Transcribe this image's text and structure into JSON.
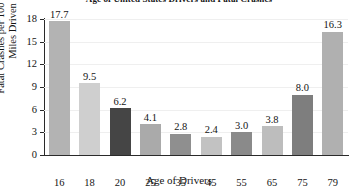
{
  "chart_data": {
    "type": "bar",
    "title": "Age of United States Drivers and Fatal Crashes",
    "xlabel": "Age of Drivers",
    "ylabel": "Fatal Crashes per 100 Million\nMiles Driven",
    "categories": [
      "16",
      "18",
      "20",
      "25",
      "35",
      "45",
      "55",
      "65",
      "75",
      "79"
    ],
    "values": [
      17.7,
      9.5,
      6.2,
      4.1,
      2.8,
      2.4,
      3.0,
      3.8,
      8.0,
      16.3
    ],
    "value_labels": [
      "17.7",
      "9.5",
      "6.2",
      "4.1",
      "2.8",
      "2.4",
      "3.0",
      "3.8",
      "8.0",
      "16.3"
    ],
    "bar_colors": [
      "#b3b3b3",
      "#cfcfcf",
      "#454545",
      "#aaaaaa",
      "#8f8f8f",
      "#c2c2c2",
      "#8a8a8a",
      "#bdbdbd",
      "#7e7e7e",
      "#b0b0b0"
    ],
    "ylim": [
      0,
      18
    ],
    "yticks": [
      0,
      3,
      6,
      9,
      12,
      15,
      18
    ],
    "ytick_labels": [
      "0",
      "3",
      "6",
      "9",
      "12",
      "15",
      "18"
    ],
    "grid": true,
    "grid_color": "#efefef",
    "axis_color": "#2a2a2a",
    "legend": null,
    "background": "#ffffff"
  }
}
